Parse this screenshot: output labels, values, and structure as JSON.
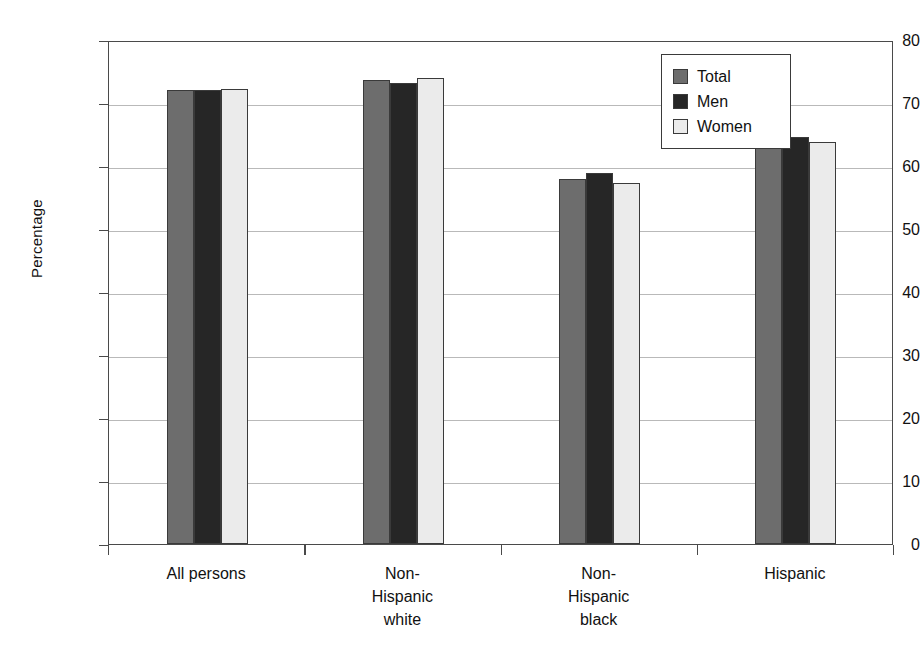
{
  "chart_data": {
    "type": "bar",
    "title": "",
    "xlabel": "",
    "ylabel": "Percentage",
    "ylim": [
      0,
      80
    ],
    "yticks": [
      0,
      10,
      20,
      30,
      40,
      50,
      60,
      70,
      80
    ],
    "ytick_labels": [
      "0",
      "10",
      "20",
      "30",
      "40",
      "50",
      "60",
      "70",
      "80"
    ],
    "grid": true,
    "legend_position": "upper right",
    "categories": [
      "All persons",
      "Non-Hispanic white",
      "Non-Hispanic black",
      "Hispanic"
    ],
    "category_label_lines": [
      [
        "All persons"
      ],
      [
        "Non-",
        "Hispanic",
        "white"
      ],
      [
        "Non-",
        "Hispanic",
        "black"
      ],
      [
        "Hispanic"
      ]
    ],
    "series": [
      {
        "name": "Total",
        "color": "#6d6d6d",
        "values": [
          72.1,
          73.6,
          58.0,
          64.2
        ]
      },
      {
        "name": "Men",
        "color": "#262626",
        "values": [
          72.0,
          73.2,
          58.9,
          64.6
        ]
      },
      {
        "name": "Women",
        "color": "#ebebeb",
        "values": [
          72.2,
          73.9,
          57.3,
          63.8
        ]
      }
    ]
  },
  "legend": {
    "items": [
      {
        "label": "Total",
        "swatch": "#6d6d6d"
      },
      {
        "label": "Men",
        "swatch": "#262626"
      },
      {
        "label": "Women",
        "swatch": "#ebebeb"
      }
    ]
  },
  "axes": {
    "y_title": "Percentage"
  }
}
